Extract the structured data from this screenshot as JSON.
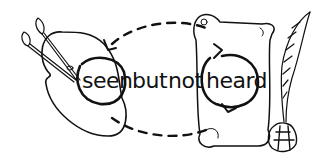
{
  "logo": {
    "text_words": [
      "seen",
      "but",
      "not",
      "heard"
    ],
    "colors": {
      "ink": "#111111",
      "background": "#ffffff"
    },
    "icons": [
      "palette-icon",
      "paintbrush-icon",
      "scroll-icon",
      "quill-icon",
      "inkwell-icon",
      "dashed-arrow-loop"
    ]
  }
}
